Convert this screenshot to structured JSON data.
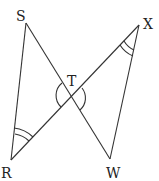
{
  "diagram": {
    "type": "geometry",
    "points": {
      "S": {
        "label": "S",
        "x": 26,
        "y": 23
      },
      "X": {
        "label": "X",
        "x": 139,
        "y": 25
      },
      "T": {
        "label": "T",
        "x": 71,
        "y": 97
      },
      "R": {
        "label": "R",
        "x": 11,
        "y": 160
      },
      "W": {
        "label": "W",
        "x": 110,
        "y": 159
      }
    },
    "segments": [
      "SR",
      "SW",
      "RX",
      "XW"
    ],
    "angle_marks": [
      {
        "vertex": "R",
        "arcs": 2
      },
      {
        "vertex": "X",
        "arcs": 2
      },
      {
        "vertex": "T",
        "arcs": 1,
        "note": "vertical angles STR and XTW"
      }
    ]
  }
}
